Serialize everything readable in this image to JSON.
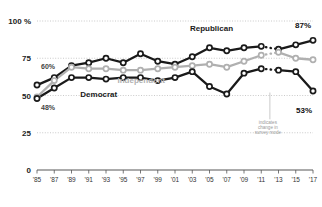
{
  "chart_data": {
    "type": "line",
    "title": "",
    "subtitle": "",
    "xlabel": "",
    "ylabel": "",
    "ylim": [
      0,
      100
    ],
    "yticks": [
      0,
      25,
      50,
      75,
      100
    ],
    "ytick_labels": [
      "0",
      "25",
      "50",
      "75",
      "100 %"
    ],
    "grid": true,
    "grid_axis": "y",
    "legend": "inline-labels",
    "x": [
      1985,
      1987,
      1989,
      1991,
      1993,
      1995,
      1997,
      1999,
      2001,
      2003,
      2005,
      2007,
      2009,
      2011,
      2013,
      2015,
      2017
    ],
    "xtick_labels": [
      "'85",
      "'87",
      "'89",
      "'91",
      "'93",
      "'95",
      "'97",
      "'99",
      "'01",
      "'03",
      "'05",
      "'07",
      "'09",
      "'11",
      "'13",
      "'15",
      "'17"
    ],
    "series": [
      {
        "name": "Republican",
        "color": "#1a1a1a",
        "marker": "open-circle",
        "values": [
          57,
          62,
          70,
          72,
          75,
          72,
          78,
          73,
          71,
          76,
          82,
          80,
          82,
          83,
          81,
          84,
          87
        ],
        "break_after_index": 13,
        "break_style": "dotted"
      },
      {
        "name": "Independent",
        "color": "#b0b0b0",
        "marker": "open-circle",
        "values": [
          49,
          60,
          69,
          68,
          68,
          67,
          67,
          68,
          69,
          70,
          71,
          69,
          73,
          77,
          79,
          75,
          74
        ],
        "break_after_index": 13,
        "break_style": "dotted"
      },
      {
        "name": "Democrat",
        "color": "#1a1a1a",
        "marker": "open-circle",
        "values": [
          48,
          55,
          62,
          62,
          61,
          62,
          62,
          60,
          62,
          66,
          56,
          51,
          65,
          68,
          67,
          66,
          53
        ],
        "break_after_index": 13,
        "break_style": "dotted"
      }
    ],
    "annotations": [
      {
        "id": "start-independent",
        "text": "60%",
        "value": 60,
        "x": 1985
      },
      {
        "id": "start-democrat",
        "text": "48%",
        "value": 48,
        "x": 1985
      },
      {
        "id": "end-republican",
        "text": "87%",
        "value": 87,
        "x": 2017
      },
      {
        "id": "end-democrat",
        "text": "53%",
        "value": 53,
        "x": 2017
      },
      {
        "id": "survey-mode-note",
        "text": "indicates change in survey mode",
        "line1": "indicates",
        "line2": "change in",
        "line3": "survey mode"
      }
    ]
  },
  "labels": {
    "republican": "Republican",
    "independent": "Independent",
    "democrat": "Democrat"
  }
}
